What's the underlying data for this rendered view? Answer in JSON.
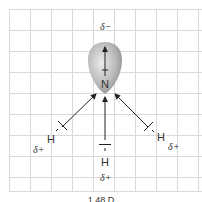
{
  "diagram": {
    "central_atom": "N",
    "hydrogen_label": "H",
    "delta_minus": "δ−",
    "delta_plus": "δ+",
    "dipole_caption": "1.48 D",
    "colors": {
      "grid": "#d9d9d9",
      "arrow": "#333333",
      "lobe_light": "#e6e6e6",
      "lobe_dark": "#8a8a8a"
    }
  }
}
